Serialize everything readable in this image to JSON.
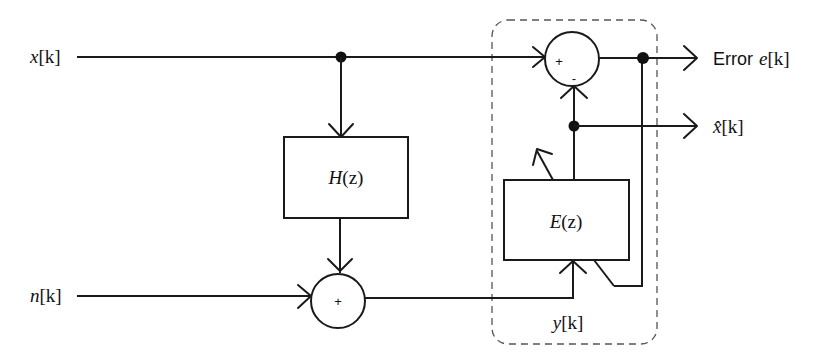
{
  "diagram": {
    "type": "block-diagram",
    "inputs": [
      {
        "id": "x",
        "label_main": "x",
        "label_index": "[k]"
      },
      {
        "id": "n",
        "label_main": "n",
        "label_index": "[k]"
      }
    ],
    "blocks": [
      {
        "id": "H",
        "label_main": "H",
        "label_arg": "(z)"
      },
      {
        "id": "E",
        "label_main": "E",
        "label_arg": "(z)",
        "adaptive": true
      }
    ],
    "summers": [
      {
        "id": "sum_noise",
        "signs": [
          "+"
        ]
      },
      {
        "id": "sum_error",
        "signs": [
          "+",
          "-"
        ]
      }
    ],
    "outputs": [
      {
        "id": "e",
        "prefix": "Error",
        "label_main": "e",
        "label_index": "[k]"
      },
      {
        "id": "xhat",
        "label_main": "x̂",
        "label_index": "[k]"
      }
    ],
    "internal_signals": [
      {
        "id": "y",
        "label_main": "y",
        "label_index": "[k]"
      }
    ],
    "colors": {
      "line": "#1a1a1a",
      "dashed": "#555555",
      "background": "#ffffff"
    }
  }
}
